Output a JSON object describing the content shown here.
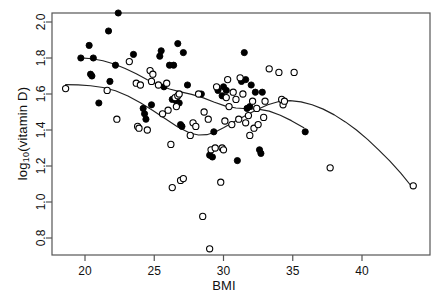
{
  "chart_data": {
    "type": "scatter",
    "title": "",
    "xlabel": "BMI",
    "ylabel": "log10(vitamin D)",
    "ylabel_base": "log",
    "ylabel_sub": "10",
    "ylabel_rest": "(vitamin D)",
    "xlim": [
      18.0,
      44.5
    ],
    "ylim": [
      0.7,
      2.08
    ],
    "xticks": [
      20,
      25,
      30,
      35,
      40
    ],
    "yticks": [
      0.8,
      1.0,
      1.2,
      1.4,
      1.6,
      1.8,
      2.0
    ],
    "xticklabels": [
      "20",
      "25",
      "30",
      "35",
      "40"
    ],
    "yticklabels": [
      "0.8",
      "1.0",
      "1.2",
      "1.4",
      "1.6",
      "1.8",
      "2.0"
    ],
    "grid": false,
    "legend": "none",
    "box": true,
    "series": [
      {
        "name": "filled",
        "marker": "filled-circle",
        "color": "#000000",
        "points": [
          [
            19.7,
            1.8
          ],
          [
            20.3,
            1.87
          ],
          [
            20.4,
            1.71
          ],
          [
            20.5,
            1.7
          ],
          [
            20.6,
            1.8
          ],
          [
            21.0,
            1.55
          ],
          [
            21.7,
            1.95
          ],
          [
            21.8,
            1.67
          ],
          [
            22.2,
            1.76
          ],
          [
            22.4,
            2.05
          ],
          [
            23.5,
            1.82
          ],
          [
            24.2,
            1.52
          ],
          [
            24.3,
            1.49
          ],
          [
            24.4,
            1.46
          ],
          [
            24.8,
            1.54
          ],
          [
            25.4,
            1.81
          ],
          [
            25.5,
            1.84
          ],
          [
            25.7,
            1.64
          ],
          [
            26.1,
            1.76
          ],
          [
            26.3,
            1.57
          ],
          [
            26.4,
            1.76
          ],
          [
            26.6,
            1.56
          ],
          [
            26.7,
            1.88
          ],
          [
            26.8,
            1.55
          ],
          [
            26.9,
            1.43
          ],
          [
            27.0,
            1.42
          ],
          [
            27.1,
            1.83
          ],
          [
            27.4,
            1.65
          ],
          [
            28.4,
            1.6
          ],
          [
            29.0,
            1.26
          ],
          [
            29.2,
            1.25
          ],
          [
            29.3,
            1.39
          ],
          [
            29.6,
            1.62
          ],
          [
            29.9,
            1.59
          ],
          [
            30.0,
            1.64
          ],
          [
            30.2,
            1.62
          ],
          [
            31.0,
            1.23
          ],
          [
            31.3,
            1.67
          ],
          [
            31.5,
            1.83
          ],
          [
            31.6,
            1.68
          ],
          [
            31.7,
            1.52
          ],
          [
            31.9,
            1.53
          ],
          [
            32.0,
            1.65
          ],
          [
            32.3,
            1.61
          ],
          [
            32.6,
            1.29
          ],
          [
            32.7,
            1.27
          ],
          [
            32.8,
            1.61
          ],
          [
            35.9,
            1.39
          ]
        ]
      },
      {
        "name": "open",
        "marker": "open-circle",
        "color": "#000000",
        "points": [
          [
            18.6,
            1.63
          ],
          [
            21.6,
            1.62
          ],
          [
            22.3,
            1.46
          ],
          [
            23.2,
            1.78
          ],
          [
            23.7,
            1.66
          ],
          [
            23.8,
            1.42
          ],
          [
            23.9,
            1.41
          ],
          [
            24.0,
            1.65
          ],
          [
            24.5,
            1.4
          ],
          [
            24.7,
            1.73
          ],
          [
            24.8,
            1.67
          ],
          [
            24.9,
            1.71
          ],
          [
            25.3,
            1.65
          ],
          [
            25.6,
            1.49
          ],
          [
            25.9,
            1.66
          ],
          [
            26.0,
            1.51
          ],
          [
            26.2,
            1.32
          ],
          [
            26.3,
            1.08
          ],
          [
            26.5,
            1.58
          ],
          [
            26.6,
            1.53
          ],
          [
            26.7,
            1.59
          ],
          [
            26.8,
            1.6
          ],
          [
            26.9,
            1.12
          ],
          [
            27.1,
            1.13
          ],
          [
            27.6,
            1.37
          ],
          [
            27.8,
            1.44
          ],
          [
            28.0,
            1.42
          ],
          [
            28.2,
            1.6
          ],
          [
            28.5,
            0.92
          ],
          [
            28.6,
            1.5
          ],
          [
            28.9,
            1.46
          ],
          [
            29.0,
            0.74
          ],
          [
            29.1,
            1.29
          ],
          [
            29.4,
            1.3
          ],
          [
            29.5,
            1.64
          ],
          [
            29.8,
            1.11
          ],
          [
            29.9,
            1.3
          ],
          [
            30.0,
            1.29
          ],
          [
            30.1,
            1.45
          ],
          [
            30.2,
            1.58
          ],
          [
            30.3,
            1.68
          ],
          [
            30.4,
            1.53
          ],
          [
            30.6,
            1.43
          ],
          [
            30.7,
            1.61
          ],
          [
            30.9,
            1.57
          ],
          [
            31.1,
            1.46
          ],
          [
            31.2,
            1.69
          ],
          [
            31.4,
            1.6
          ],
          [
            31.6,
            1.44
          ],
          [
            31.8,
            1.48
          ],
          [
            31.9,
            1.37
          ],
          [
            32.1,
            1.56
          ],
          [
            32.2,
            1.41
          ],
          [
            32.4,
            1.52
          ],
          [
            32.5,
            1.43
          ],
          [
            32.9,
            1.47
          ],
          [
            33.0,
            1.56
          ],
          [
            33.3,
            1.74
          ],
          [
            34.0,
            1.72
          ],
          [
            34.2,
            1.57
          ],
          [
            34.3,
            1.54
          ],
          [
            34.4,
            1.56
          ],
          [
            35.1,
            1.72
          ],
          [
            37.7,
            1.19
          ],
          [
            43.7,
            1.09
          ]
        ]
      }
    ],
    "smoothers": [
      {
        "name": "filled-smoother",
        "points": [
          [
            19.7,
            1.801
          ],
          [
            20.5,
            1.796
          ],
          [
            21.3,
            1.785
          ],
          [
            22.1,
            1.767
          ],
          [
            22.9,
            1.742
          ],
          [
            23.7,
            1.712
          ],
          [
            24.5,
            1.679
          ],
          [
            25.3,
            1.65
          ],
          [
            26.1,
            1.628
          ],
          [
            26.9,
            1.612
          ],
          [
            27.7,
            1.598
          ],
          [
            28.5,
            1.58
          ],
          [
            29.3,
            1.556
          ],
          [
            30.1,
            1.534
          ],
          [
            30.9,
            1.522
          ],
          [
            31.7,
            1.518
          ],
          [
            32.5,
            1.516
          ],
          [
            33.3,
            1.505
          ],
          [
            34.1,
            1.482
          ],
          [
            34.9,
            1.452
          ],
          [
            35.8,
            1.412
          ]
        ]
      },
      {
        "name": "open-smoother",
        "points": [
          [
            18.6,
            1.652
          ],
          [
            19.5,
            1.651
          ],
          [
            20.4,
            1.646
          ],
          [
            21.3,
            1.636
          ],
          [
            22.2,
            1.618
          ],
          [
            23.1,
            1.589
          ],
          [
            24.0,
            1.551
          ],
          [
            24.9,
            1.508
          ],
          [
            25.8,
            1.462
          ],
          [
            26.7,
            1.417
          ],
          [
            27.6,
            1.382
          ],
          [
            28.2,
            1.372
          ],
          [
            28.8,
            1.374
          ],
          [
            29.4,
            1.389
          ],
          [
            30.0,
            1.413
          ],
          [
            30.8,
            1.447
          ],
          [
            31.6,
            1.481
          ],
          [
            32.4,
            1.513
          ],
          [
            33.2,
            1.54
          ],
          [
            34.0,
            1.558
          ],
          [
            34.8,
            1.563
          ],
          [
            35.6,
            1.556
          ],
          [
            36.4,
            1.54
          ],
          [
            37.2,
            1.516
          ],
          [
            38.0,
            1.484
          ],
          [
            38.8,
            1.445
          ],
          [
            39.6,
            1.4
          ],
          [
            40.4,
            1.348
          ],
          [
            41.2,
            1.29
          ],
          [
            42.0,
            1.228
          ],
          [
            42.8,
            1.16
          ],
          [
            43.7,
            1.075
          ]
        ]
      }
    ]
  },
  "geometry": {
    "plot_left": 52,
    "plot_right": 430,
    "plot_top": 13,
    "plot_bottom": 255,
    "x_pix_20": 85,
    "x_pix_40": 362,
    "y_pix_2_0": 22,
    "y_pix_0_8": 238,
    "marker_radius": 3.1,
    "axis_color": "#555555",
    "line_color": "#222222"
  }
}
